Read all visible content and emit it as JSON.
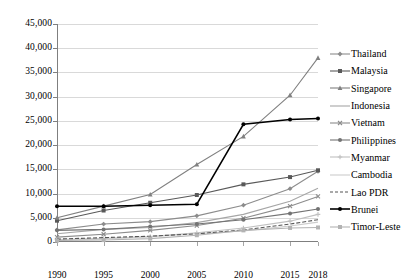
{
  "chart_data": {
    "type": "line",
    "title": "",
    "subtitle": "",
    "xlabel": "",
    "ylabel": "",
    "x": [
      1990,
      1995,
      2000,
      2005,
      2010,
      2015,
      2018
    ],
    "xtick_labels": [
      "1990",
      "1995",
      "2000",
      "2005",
      "2010",
      "2015",
      "2018"
    ],
    "ytick_labels": [
      "0",
      "5,000",
      "10,000",
      "15,000",
      "20,000",
      "25,000",
      "30,000",
      "35,000",
      "40,000",
      "45,000"
    ],
    "ytick_values": [
      0,
      5000,
      10000,
      15000,
      20000,
      25000,
      30000,
      35000,
      40000,
      45000
    ],
    "ylim": [
      0,
      45000
    ],
    "grid": true,
    "legend_position": "right",
    "series": [
      {
        "name": "Thailand",
        "marker": "diamond",
        "color": "#8c8c8c",
        "values": [
          2500,
          3700,
          4200,
          5400,
          7600,
          11000,
          14600
        ]
      },
      {
        "name": "Malaysia",
        "marker": "square",
        "color": "#595959",
        "values": [
          4400,
          6500,
          8100,
          9700,
          11900,
          13400,
          14800
        ]
      },
      {
        "name": "Singapore",
        "marker": "triangle",
        "color": "#808080",
        "values": [
          5000,
          7400,
          9800,
          16000,
          21800,
          30300,
          38000
        ]
      },
      {
        "name": "Indonesia",
        "marker": "none",
        "color": "#a6a6a6",
        "values": [
          1700,
          2600,
          3000,
          4000,
          5700,
          8400,
          11100
        ]
      },
      {
        "name": "Vietnam",
        "marker": "x",
        "color": "#8c8c8c",
        "values": [
          1000,
          1600,
          2400,
          3400,
          4900,
          7400,
          9400
        ]
      },
      {
        "name": "Philippines",
        "marker": "circle",
        "color": "#737373",
        "values": [
          2400,
          2600,
          3200,
          3700,
          4600,
          5900,
          6800
        ]
      },
      {
        "name": "Myanmar",
        "marker": "plus",
        "color": "#c0c0c0",
        "values": [
          500,
          700,
          1100,
          1900,
          2900,
          4300,
          5700
        ]
      },
      {
        "name": "Cambodia",
        "marker": "none",
        "color": "#cccccc",
        "values": [
          400,
          700,
          1100,
          1700,
          2300,
          3300,
          4100
        ]
      },
      {
        "name": "Lao PDR",
        "marker": "dashed",
        "color": "#555555",
        "values": [
          600,
          900,
          1200,
          1700,
          2500,
          3700,
          4600
        ]
      },
      {
        "name": "Brunei",
        "marker": "dot-dark",
        "color": "#000000",
        "values": [
          7400,
          7400,
          7600,
          7800,
          24300,
          25300,
          25500
        ]
      },
      {
        "name": "Timor-Leste",
        "marker": "square",
        "color": "#b3b3b3",
        "values": [
          300,
          400,
          700,
          1400,
          2400,
          2900,
          3000
        ]
      }
    ]
  },
  "legend": {
    "items": [
      {
        "label": "Thailand"
      },
      {
        "label": "Malaysia"
      },
      {
        "label": "Singapore"
      },
      {
        "label": "Indonesia"
      },
      {
        "label": "Vietnam"
      },
      {
        "label": "Philippines"
      },
      {
        "label": "Myanmar"
      },
      {
        "label": "Cambodia"
      },
      {
        "label": "Lao PDR"
      },
      {
        "label": "Brunei"
      },
      {
        "label": "Timor-Leste"
      }
    ]
  }
}
